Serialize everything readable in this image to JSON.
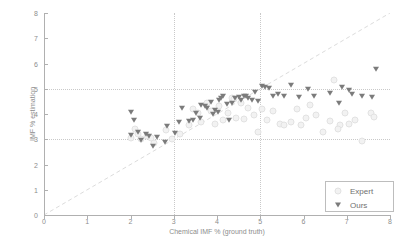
{
  "chart_data": {
    "type": "scatter",
    "title": "",
    "xlabel": "Chemical IMF % (ground truth)",
    "ylabel": "IMF % estimation",
    "xlim": [
      0,
      8
    ],
    "ylim": [
      0,
      8
    ],
    "xticks": [
      0,
      1,
      2,
      3,
      4,
      5,
      6,
      7,
      8
    ],
    "yticks": [
      0,
      1,
      2,
      3,
      4,
      5,
      6,
      7,
      8
    ],
    "grid": true,
    "gridlines_v": [
      3,
      5
    ],
    "gridlines_h": [
      3,
      5
    ],
    "reference_line": {
      "name": "identity",
      "style": "dashed",
      "from": [
        0,
        0
      ],
      "to": [
        8,
        8
      ],
      "color": "#d9d9d9"
    },
    "legend": {
      "position": "lower-right",
      "entries": [
        "Expert",
        "Ours"
      ]
    },
    "series": [
      {
        "name": "Expert",
        "marker": "circle",
        "color": "#f2f2f2",
        "points": [
          [
            2.02,
            3.05
          ],
          [
            2.1,
            3.4
          ],
          [
            2.25,
            3.0
          ],
          [
            2.38,
            3.12
          ],
          [
            2.55,
            2.85
          ],
          [
            2.82,
            3.35
          ],
          [
            2.95,
            3.0
          ],
          [
            3.15,
            3.2
          ],
          [
            3.35,
            3.55
          ],
          [
            3.55,
            4.05
          ],
          [
            3.62,
            3.7
          ],
          [
            3.78,
            4.45
          ],
          [
            3.85,
            4.1
          ],
          [
            3.95,
            3.62
          ],
          [
            4.05,
            4.3
          ],
          [
            4.15,
            3.75
          ],
          [
            4.25,
            4.05
          ],
          [
            4.35,
            4.62
          ],
          [
            4.45,
            3.85
          ],
          [
            4.55,
            4.45
          ],
          [
            4.62,
            3.82
          ],
          [
            4.72,
            4.25
          ],
          [
            4.85,
            3.95
          ],
          [
            4.95,
            3.3
          ],
          [
            5.05,
            4.2
          ],
          [
            5.15,
            3.75
          ],
          [
            5.3,
            4.12
          ],
          [
            5.45,
            3.6
          ],
          [
            5.55,
            3.58
          ],
          [
            5.72,
            3.7
          ],
          [
            5.85,
            4.2
          ],
          [
            6.05,
            3.85
          ],
          [
            6.15,
            4.35
          ],
          [
            6.3,
            3.95
          ],
          [
            6.45,
            3.3
          ],
          [
            6.62,
            3.72
          ],
          [
            6.7,
            5.35
          ],
          [
            6.85,
            3.58
          ],
          [
            6.95,
            4.05
          ],
          [
            7.05,
            3.62
          ],
          [
            7.2,
            3.78
          ],
          [
            7.35,
            2.95
          ],
          [
            7.55,
            4.05
          ],
          [
            7.62,
            3.88
          ],
          [
            4.4,
            4.58
          ],
          [
            3.45,
            4.18
          ],
          [
            2.18,
            3.22
          ],
          [
            2.48,
            3.05
          ],
          [
            5.95,
            3.55
          ],
          [
            6.8,
            3.4
          ]
        ]
      },
      {
        "name": "Ours",
        "marker": "triangle-down",
        "color": "#7b7b7b",
        "points": [
          [
            2.0,
            4.08
          ],
          [
            2.02,
            3.15
          ],
          [
            2.08,
            3.78
          ],
          [
            2.18,
            3.3
          ],
          [
            2.25,
            2.98
          ],
          [
            2.35,
            3.22
          ],
          [
            2.42,
            3.12
          ],
          [
            2.52,
            2.72
          ],
          [
            2.62,
            3.08
          ],
          [
            2.8,
            2.88
          ],
          [
            2.85,
            3.52
          ],
          [
            3.02,
            3.25
          ],
          [
            3.12,
            3.68
          ],
          [
            3.2,
            4.25
          ],
          [
            3.35,
            3.72
          ],
          [
            3.45,
            3.78
          ],
          [
            3.52,
            4.02
          ],
          [
            3.6,
            3.85
          ],
          [
            3.62,
            4.35
          ],
          [
            3.72,
            4.3
          ],
          [
            3.78,
            4.25
          ],
          [
            3.85,
            4.48
          ],
          [
            3.9,
            4.0
          ],
          [
            3.95,
            4.15
          ],
          [
            4.02,
            4.08
          ],
          [
            4.05,
            4.55
          ],
          [
            4.1,
            4.62
          ],
          [
            4.15,
            4.72
          ],
          [
            4.22,
            4.38
          ],
          [
            4.28,
            3.75
          ],
          [
            4.35,
            4.42
          ],
          [
            4.42,
            4.62
          ],
          [
            4.5,
            4.68
          ],
          [
            4.55,
            4.55
          ],
          [
            4.62,
            4.72
          ],
          [
            4.68,
            4.7
          ],
          [
            4.72,
            4.62
          ],
          [
            4.8,
            4.55
          ],
          [
            4.88,
            4.88
          ],
          [
            4.95,
            4.52
          ],
          [
            5.05,
            5.1
          ],
          [
            5.12,
            5.08
          ],
          [
            5.2,
            5.02
          ],
          [
            5.3,
            4.72
          ],
          [
            5.42,
            4.8
          ],
          [
            5.55,
            4.72
          ],
          [
            5.72,
            5.15
          ],
          [
            5.9,
            4.68
          ],
          [
            6.1,
            4.98
          ],
          [
            6.25,
            4.72
          ],
          [
            6.62,
            4.85
          ],
          [
            6.82,
            4.42
          ],
          [
            6.9,
            5.05
          ],
          [
            7.05,
            4.95
          ],
          [
            7.12,
            4.78
          ],
          [
            7.35,
            4.7
          ],
          [
            7.58,
            4.68
          ],
          [
            7.68,
            5.8
          ]
        ]
      }
    ]
  },
  "legend": {
    "expert_label": "Expert",
    "ours_label": "Ours"
  }
}
